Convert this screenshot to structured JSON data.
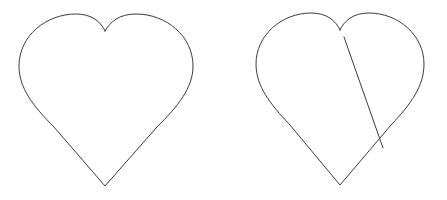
{
  "figure": {
    "background_color": "#ffffff",
    "stroke_color": "#3b3b3f",
    "stroke_width": 1,
    "canvas": {
      "width": 447,
      "height": 200
    }
  },
  "shapes": [
    {
      "id": "heart-left",
      "label": "Plain heart outline",
      "position": "left",
      "bounds": {
        "x": 19,
        "y": 14,
        "width": 174,
        "height": 172
      },
      "cleft_point": {
        "x": 105,
        "y": 31
      },
      "bottom_tip": {
        "x": 105,
        "y": 186
      },
      "left_extreme": {
        "x": 19,
        "y": 62
      },
      "right_extreme": {
        "x": 193,
        "y": 62
      },
      "left_lobe_peak": {
        "x": 62,
        "y": 15
      },
      "right_lobe_peak": {
        "x": 150,
        "y": 14
      },
      "path": "M 105 31 C 101 22 92 14 76 14 C 46 14 19 36 19 66 C 19 88 33 106 54 127 L 105 186 L 157 127 C 178 106 193 88 193 66 C 193 36 166 14 136 14 C 119 14 110 22 105 31 Z",
      "has_chord": false
    },
    {
      "id": "heart-right",
      "label": "Heart outline with straight line across it",
      "position": "right",
      "bounds": {
        "x": 256,
        "y": 13,
        "width": 168,
        "height": 172
      },
      "cleft_point": {
        "x": 340,
        "y": 30
      },
      "bottom_tip": {
        "x": 340,
        "y": 185
      },
      "left_extreme": {
        "x": 256,
        "y": 62
      },
      "right_extreme": {
        "x": 424,
        "y": 62
      },
      "left_lobe_peak": {
        "x": 298,
        "y": 14
      },
      "right_lobe_peak": {
        "x": 385,
        "y": 13
      },
      "path": "M 340 30 C 336 21 327 13 311 13 C 282 13 256 35 256 64 C 256 86 270 104 290 125 L 340 185 L 391 125 C 411 104 424 86 424 64 C 424 35 398 13 369 13 C 353 13 344 21 340 30 Z",
      "has_chord": true,
      "chord": {
        "id": "chord-line",
        "label": "Straight line across right heart",
        "start": {
          "x": 344,
          "y": 37
        },
        "end": {
          "x": 383,
          "y": 148
        },
        "crossing_point": {
          "x": 377,
          "y": 134
        }
      }
    }
  ]
}
